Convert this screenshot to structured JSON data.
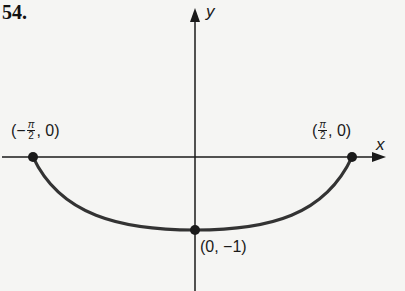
{
  "problem_number": "54.",
  "axes": {
    "x_label": "x",
    "y_label": "y"
  },
  "points": {
    "left": {
      "open": "(",
      "sign": "−",
      "num": "π",
      "den": "2",
      "rest": ", 0)"
    },
    "right": {
      "open": "(",
      "sign": "",
      "num": "π",
      "den": "2",
      "rest": ", 0)"
    },
    "bottom": {
      "label": "(0, −1)"
    }
  },
  "colors": {
    "ink": "#1a1a1a",
    "curve": "#333333",
    "background": "#f5f5f3"
  }
}
